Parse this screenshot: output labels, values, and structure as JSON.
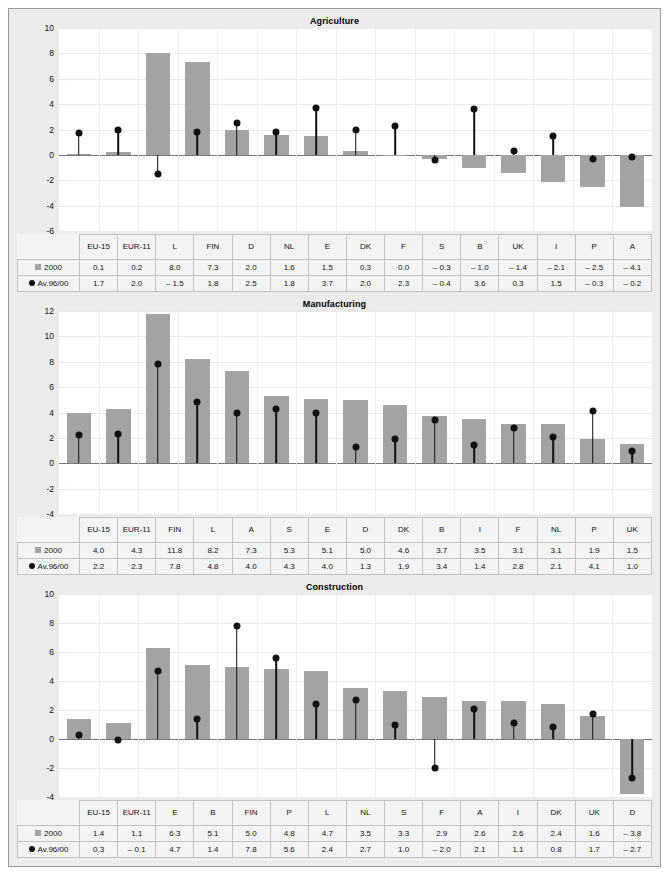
{
  "legend": {
    "series_2000_label": "2000",
    "series_avg_label": "Av.96/00",
    "series_2000_color": "#a3a3a3",
    "series_avg_color": "#111111"
  },
  "chart_data": [
    {
      "type": "bar",
      "title": "Agriculture",
      "xlabel": "",
      "ylabel": "",
      "ylim": [
        -6,
        10
      ],
      "yticks": [
        10,
        8,
        6,
        4,
        2,
        0,
        -2,
        -4,
        -6
      ],
      "ytick_labels": [
        "10",
        "8",
        "6",
        "4",
        "2",
        "0",
        "-2",
        "-4",
        "-6"
      ],
      "grid": true,
      "legend_position": "table",
      "categories": [
        "EU-15",
        "EUR-11",
        "L",
        "FIN",
        "D",
        "NL",
        "E",
        "DK",
        "F",
        "S",
        "B",
        "UK",
        "I",
        "P",
        "A"
      ],
      "series": [
        {
          "name": "2000",
          "kind": "bar",
          "values": [
            0.1,
            0.2,
            8.0,
            7.3,
            2.0,
            1.6,
            1.5,
            0.3,
            0.0,
            -0.3,
            -1.0,
            -1.4,
            -2.1,
            -2.5,
            -4.1
          ],
          "labels": [
            "0.1",
            "0.2",
            "8.0",
            "7.3",
            "2.0",
            "1.6",
            "1.5",
            "0.3",
            "0.0",
            "– 0.3",
            "– 1.0",
            "– 1.4",
            "– 2.1",
            "– 2.5",
            "– 4.1"
          ]
        },
        {
          "name": "Av.96/00",
          "kind": "marker",
          "values": [
            1.7,
            2.0,
            -1.5,
            1.8,
            2.5,
            1.8,
            3.7,
            2.0,
            2.3,
            -0.4,
            3.6,
            0.3,
            1.5,
            -0.3,
            -0.2
          ],
          "labels": [
            "1.7",
            "2.0",
            "– 1.5",
            "1.8",
            "2.5",
            "1.8",
            "3.7",
            "2.0",
            "2.3",
            "– 0.4",
            "3.6",
            "0.3",
            "1.5",
            "– 0.3",
            "– 0.2"
          ]
        }
      ]
    },
    {
      "type": "bar",
      "title": "Manufacturing",
      "xlabel": "",
      "ylabel": "",
      "ylim": [
        -4,
        12
      ],
      "yticks": [
        12,
        10,
        8,
        6,
        4,
        2,
        0,
        -2,
        -4
      ],
      "ytick_labels": [
        "12",
        "10",
        "8",
        "6",
        "4",
        "2",
        "0",
        "-2",
        "-4"
      ],
      "grid": true,
      "legend_position": "table",
      "categories": [
        "EU-15",
        "EUR-11",
        "FIN",
        "L",
        "A",
        "S",
        "E",
        "D",
        "DK",
        "B",
        "I",
        "F",
        "NL",
        "P",
        "UK"
      ],
      "series": [
        {
          "name": "2000",
          "kind": "bar",
          "values": [
            4.0,
            4.3,
            11.8,
            8.2,
            7.3,
            5.3,
            5.1,
            5.0,
            4.6,
            3.7,
            3.5,
            3.1,
            3.1,
            1.9,
            1.5
          ],
          "labels": [
            "4.0",
            "4.3",
            "11.8",
            "8.2",
            "7.3",
            "5.3",
            "5.1",
            "5.0",
            "4.6",
            "3.7",
            "3.5",
            "3.1",
            "3.1",
            "1.9",
            "1.5"
          ]
        },
        {
          "name": "Av.96/00",
          "kind": "marker",
          "values": [
            2.2,
            2.3,
            7.8,
            4.8,
            4.0,
            4.3,
            4.0,
            1.3,
            1.9,
            3.4,
            1.4,
            2.8,
            2.1,
            4.1,
            1.0
          ],
          "labels": [
            "2.2",
            "2.3",
            "7.8",
            "4.8",
            "4.0",
            "4.3",
            "4.0",
            "1.3",
            "1.9",
            "3.4",
            "1.4",
            "2.8",
            "2.1",
            "4.1",
            "1.0"
          ]
        }
      ]
    },
    {
      "type": "bar",
      "title": "Construction",
      "xlabel": "",
      "ylabel": "",
      "ylim": [
        -4,
        10
      ],
      "yticks": [
        10,
        8,
        6,
        4,
        2,
        0,
        -2,
        -4
      ],
      "ytick_labels": [
        "10",
        "8",
        "6",
        "4",
        "2",
        "0",
        "-2",
        "-4"
      ],
      "grid": true,
      "legend_position": "table",
      "categories": [
        "EU-15",
        "EUR-11",
        "E",
        "B",
        "FIN",
        "P",
        "L",
        "NL",
        "S",
        "F",
        "A",
        "I",
        "DK",
        "UK",
        "D"
      ],
      "series": [
        {
          "name": "2000",
          "kind": "bar",
          "values": [
            1.4,
            1.1,
            6.3,
            5.1,
            5.0,
            4.8,
            4.7,
            3.5,
            3.3,
            2.9,
            2.6,
            2.6,
            2.4,
            1.6,
            -3.8
          ],
          "labels": [
            "1.4",
            "1.1",
            "6.3",
            "5.1",
            "5.0",
            "4.8",
            "4.7",
            "3.5",
            "3.3",
            "2.9",
            "2.6",
            "2.6",
            "2.4",
            "1.6",
            "– 3.8"
          ]
        },
        {
          "name": "Av.96/00",
          "kind": "marker",
          "values": [
            0.3,
            -0.1,
            4.7,
            1.4,
            7.8,
            5.6,
            2.4,
            2.7,
            1.0,
            -2.0,
            2.1,
            1.1,
            0.8,
            1.7,
            -2.7
          ],
          "labels": [
            "0.3",
            "– 0.1",
            "4.7",
            "1.4",
            "7.8",
            "5.6",
            "2.4",
            "2.7",
            "1.0",
            "– 2.0",
            "2.1",
            "1.1",
            "0.8",
            "1.7",
            "– 2.7"
          ]
        }
      ]
    }
  ]
}
